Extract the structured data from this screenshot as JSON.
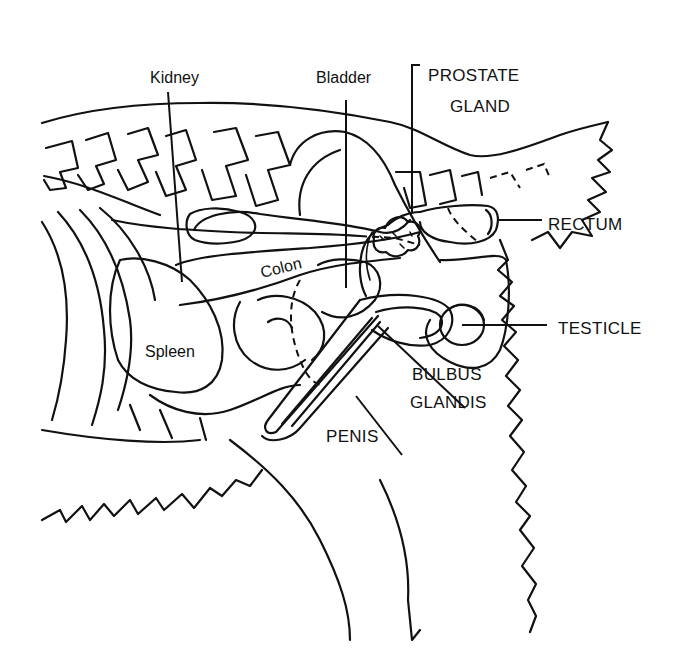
{
  "diagram": {
    "labels": {
      "kidney": "Kidney",
      "bladder": "Bladder",
      "prostate_line1": "PROSTATE",
      "prostate_line2": "GLAND",
      "rectum": "RECTUM",
      "colon": "Colon",
      "spleen": "Spleen",
      "testicle": "TESTICLE",
      "bulbus_line1": "BULBUS",
      "bulbus_line2": "GLANDIS",
      "penis": "PENIS"
    },
    "colors": {
      "ink": "#111111",
      "background": "#ffffff"
    }
  }
}
